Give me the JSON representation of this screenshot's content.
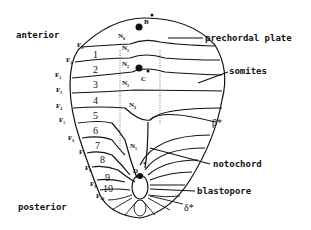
{
  "diagram": {
    "orientation_labels": {
      "anterior": "anterior",
      "posterior": "posterior"
    },
    "callouts": {
      "prechordal_plate": "prechordal plate",
      "somites": "somites",
      "notochord": "notochord",
      "blastopore": "blastopore"
    },
    "points": {
      "B": "B",
      "B_star": "*",
      "C": "C",
      "D": "D",
      "D_star": "*",
      "beta_star": "β*",
      "delta_star": "δ*"
    },
    "somite_numbers": [
      "1",
      "2",
      "3",
      "4",
      "5",
      "6",
      "7",
      "8",
      "9",
      "10"
    ],
    "F_labels": [
      {
        "base": "F",
        "sub": "0"
      },
      {
        "base": "F",
        "sub": "1"
      },
      {
        "base": "F",
        "sub": "2"
      },
      {
        "base": "F",
        "sub": "3"
      },
      {
        "base": "F",
        "sub": "4"
      },
      {
        "base": "F",
        "sub": "5"
      },
      {
        "base": "F",
        "sub": "6"
      },
      {
        "base": "F",
        "sub": "7"
      },
      {
        "base": "F",
        "sub": "8"
      },
      {
        "base": "F",
        "sub": "9"
      },
      {
        "base": "F",
        "sub": "10"
      }
    ],
    "N_labels": [
      {
        "base": "N",
        "sub": "0"
      },
      {
        "base": "N",
        "sub": "1"
      },
      {
        "base": "N",
        "sub": "2"
      },
      {
        "base": "N",
        "sub": "3"
      },
      {
        "base": "N",
        "sub": "4"
      },
      {
        "base": "N",
        "sub": "5"
      }
    ],
    "colors": {
      "ink": "#111111",
      "background": "#ffffff"
    }
  }
}
